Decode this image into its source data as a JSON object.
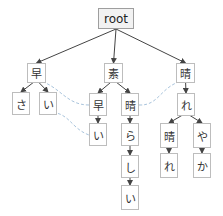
{
  "diagram": {
    "type": "trie",
    "colors": {
      "edge": "#444444",
      "dashed": "#a9c4dc",
      "border": "#bdbdbd",
      "root_fill": "#f2f2f2"
    },
    "nodes": [
      {
        "id": "root",
        "label": "root",
        "x": 98,
        "y": 8,
        "w": 36,
        "h": 21
      },
      {
        "id": "n1",
        "label": "早",
        "x": 27,
        "y": 63,
        "w": 19,
        "h": 20
      },
      {
        "id": "n2",
        "label": "素",
        "x": 104,
        "y": 63,
        "w": 19,
        "h": 20
      },
      {
        "id": "n3",
        "label": "晴",
        "x": 176,
        "y": 63,
        "w": 19,
        "h": 20
      },
      {
        "id": "n4",
        "label": "さ",
        "x": 12,
        "y": 92,
        "w": 18,
        "h": 23
      },
      {
        "id": "n5",
        "label": "い",
        "x": 39,
        "y": 92,
        "w": 18,
        "h": 23
      },
      {
        "id": "n6",
        "label": "早",
        "x": 89,
        "y": 93,
        "w": 18,
        "h": 23
      },
      {
        "id": "n7",
        "label": "晴",
        "x": 121,
        "y": 93,
        "w": 18,
        "h": 23
      },
      {
        "id": "n8",
        "label": "れ",
        "x": 177,
        "y": 93,
        "w": 18,
        "h": 23
      },
      {
        "id": "n9",
        "label": "い",
        "x": 89,
        "y": 123,
        "w": 18,
        "h": 23
      },
      {
        "id": "n10",
        "label": "ら",
        "x": 121,
        "y": 123,
        "w": 18,
        "h": 23
      },
      {
        "id": "n11",
        "label": "晴",
        "x": 160,
        "y": 123,
        "w": 18,
        "h": 25
      },
      {
        "id": "n12",
        "label": "や",
        "x": 193,
        "y": 123,
        "w": 18,
        "h": 25
      },
      {
        "id": "n13",
        "label": "し",
        "x": 121,
        "y": 155,
        "w": 18,
        "h": 23
      },
      {
        "id": "n14",
        "label": "れ",
        "x": 160,
        "y": 153,
        "w": 18,
        "h": 25
      },
      {
        "id": "n15",
        "label": "か",
        "x": 193,
        "y": 153,
        "w": 18,
        "h": 25
      },
      {
        "id": "n16",
        "label": "い",
        "x": 121,
        "y": 185,
        "w": 18,
        "h": 25
      }
    ],
    "edges": [
      [
        "root",
        "n1"
      ],
      [
        "root",
        "n2"
      ],
      [
        "root",
        "n3"
      ],
      [
        "n1",
        "n4"
      ],
      [
        "n1",
        "n5"
      ],
      [
        "n2",
        "n6"
      ],
      [
        "n2",
        "n7"
      ],
      [
        "n3",
        "n8"
      ],
      [
        "n6",
        "n9"
      ],
      [
        "n7",
        "n10"
      ],
      [
        "n8",
        "n11"
      ],
      [
        "n8",
        "n12"
      ],
      [
        "n10",
        "n13"
      ],
      [
        "n11",
        "n14"
      ],
      [
        "n12",
        "n15"
      ],
      [
        "n13",
        "n16"
      ]
    ],
    "dashed_links": [
      {
        "from": "n6",
        "to": "n1",
        "note": "早 link"
      },
      {
        "from": "n5",
        "to": "n9",
        "note": "い link"
      },
      {
        "from": "n7",
        "to": "n3",
        "note": "晴 link"
      }
    ],
    "terminal_dots": [
      "n4",
      "n5",
      "n9",
      "n14",
      "n15",
      "n16"
    ]
  }
}
